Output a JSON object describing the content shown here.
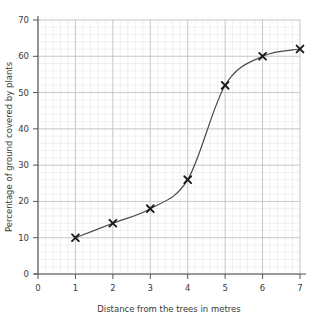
{
  "chart_data": {
    "type": "line",
    "title": "",
    "subtitle": "",
    "xlabel": "Distance from the trees in metres",
    "ylabel": "Percentage of ground covered by plants",
    "x": [
      1,
      2,
      3,
      4,
      5,
      6,
      7
    ],
    "values": [
      10,
      14,
      18,
      26,
      52,
      60,
      62
    ],
    "series": [
      {
        "name": "Percentage of ground covered by plants",
        "x": [
          1,
          2,
          3,
          4,
          5,
          6,
          7
        ],
        "values": [
          10,
          14,
          18,
          26,
          52,
          60,
          62
        ]
      }
    ],
    "xlim": [
      0,
      7
    ],
    "ylim": [
      0,
      70
    ],
    "xticks": [
      0,
      1,
      2,
      3,
      4,
      5,
      6,
      7
    ],
    "yticks": [
      0,
      10,
      20,
      30,
      40,
      50,
      60,
      70
    ],
    "xtick_labels": [
      "0",
      "1",
      "2",
      "3",
      "4",
      "5",
      "6",
      "7"
    ],
    "ytick_labels": [
      "0",
      "10",
      "20",
      "30",
      "40",
      "50",
      "60",
      "70"
    ],
    "grid": true,
    "minor_grid": true,
    "minor_grid_x_step": 0.2,
    "minor_grid_y_step": 2,
    "major_grid_x_step": 1,
    "major_grid_y_step": 10,
    "legend": false,
    "legend_position": "none",
    "marker": "x",
    "line_style": "smooth-curve",
    "annotations": []
  },
  "style": {
    "background": "#ffffff",
    "line_color": "#4a4a4a",
    "marker_color": "#1a1a1a",
    "axis_color": "#555555",
    "major_grid_color": "#b9b9b9",
    "minor_grid_color": "#e2e2e2",
    "text_color": "#3a3a3a"
  }
}
